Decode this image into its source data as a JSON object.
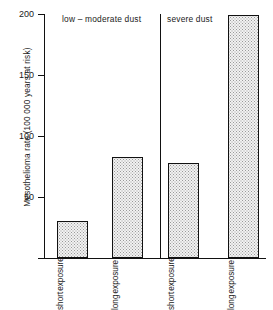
{
  "chart_data": {
    "type": "bar",
    "title": "",
    "xlabel": "",
    "ylabel": "Mesothelioma rate (100 000 years at risk)",
    "ylim": [
      0,
      200
    ],
    "yticks": [
      0,
      50,
      100,
      150,
      200
    ],
    "ytick_labels": [
      "50",
      "100",
      "150",
      "200"
    ],
    "grid": false,
    "legend": "none",
    "groups": [
      {
        "label": "low – moderate dust"
      },
      {
        "label": "severe dust"
      }
    ],
    "categories": [
      "short exposure",
      "long exposure",
      "short exposure",
      "long exposure"
    ],
    "bars": [
      {
        "group": "low – moderate dust",
        "word1": "short",
        "word2": "exposure",
        "value": 30
      },
      {
        "group": "low – moderate dust",
        "word1": "long",
        "word2": "exposure",
        "value": 83
      },
      {
        "group": "severe dust",
        "word1": "short",
        "word2": "exposure",
        "value": 78
      },
      {
        "group": "severe dust",
        "word1": "long",
        "word2": "exposure",
        "value": 199
      }
    ],
    "values": [
      30,
      83,
      78,
      199
    ],
    "colors": {
      "axis": "#111111",
      "bar_fill": "#f2f2f2",
      "bar_edge": "#111111",
      "bar_pattern": "#9a9a9a",
      "text": "#1a1a1a",
      "background": "#ffffff"
    }
  }
}
